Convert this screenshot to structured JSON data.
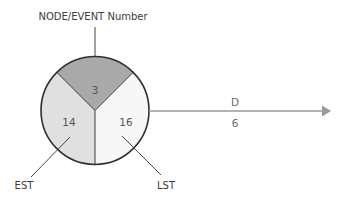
{
  "diagram": {
    "title_label": "NODE/EVENT Number",
    "node": {
      "event_number": "3",
      "est_value": "14",
      "lst_value": "16"
    },
    "leader_labels": {
      "est": "EST",
      "lst": "LST"
    },
    "activity": {
      "name": "D",
      "duration": "6"
    },
    "colors": {
      "top_segment": "#a9a9a9",
      "left_segment": "#e0e0e0",
      "right_segment": "#f7f7f7",
      "outline": "#333333",
      "arrow": "#9a9a9a"
    }
  }
}
